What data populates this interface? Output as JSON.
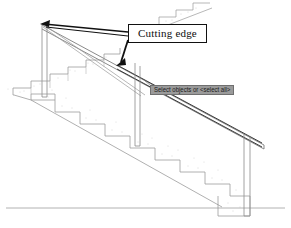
{
  "drawing": {
    "title": "Stair section with handrail",
    "background_color": "#ffffff",
    "line_color": "#8c8c8c",
    "heavy_line_color": "#111111",
    "hatch_color": "#a8a8a8"
  },
  "callout": {
    "label": "Cutting edge",
    "border_color": "#111111",
    "fill_color": "#ffffff",
    "text_color": "#0d0d0d"
  },
  "tooltip": {
    "label": "Select objects or <select all>",
    "background_color": "#9a9a9a",
    "border_color": "#6f6f6f",
    "text_color": "#1a1a1a"
  },
  "annotations": {
    "leader_1_name": "leader-to-handrail-top",
    "leader_2_name": "leader-to-handrail-mid",
    "arrow_color": "#111111"
  },
  "geometry": {
    "ground_line_y": 208,
    "handrail_label": "handrail",
    "post_left_label": "newel-post-left",
    "post_mid_label": "newel-post-mid",
    "post_right_label": "newel-post-right",
    "stair_label": "concrete-stair-flight",
    "upper_stair_label": "upper-stair-fragment"
  }
}
